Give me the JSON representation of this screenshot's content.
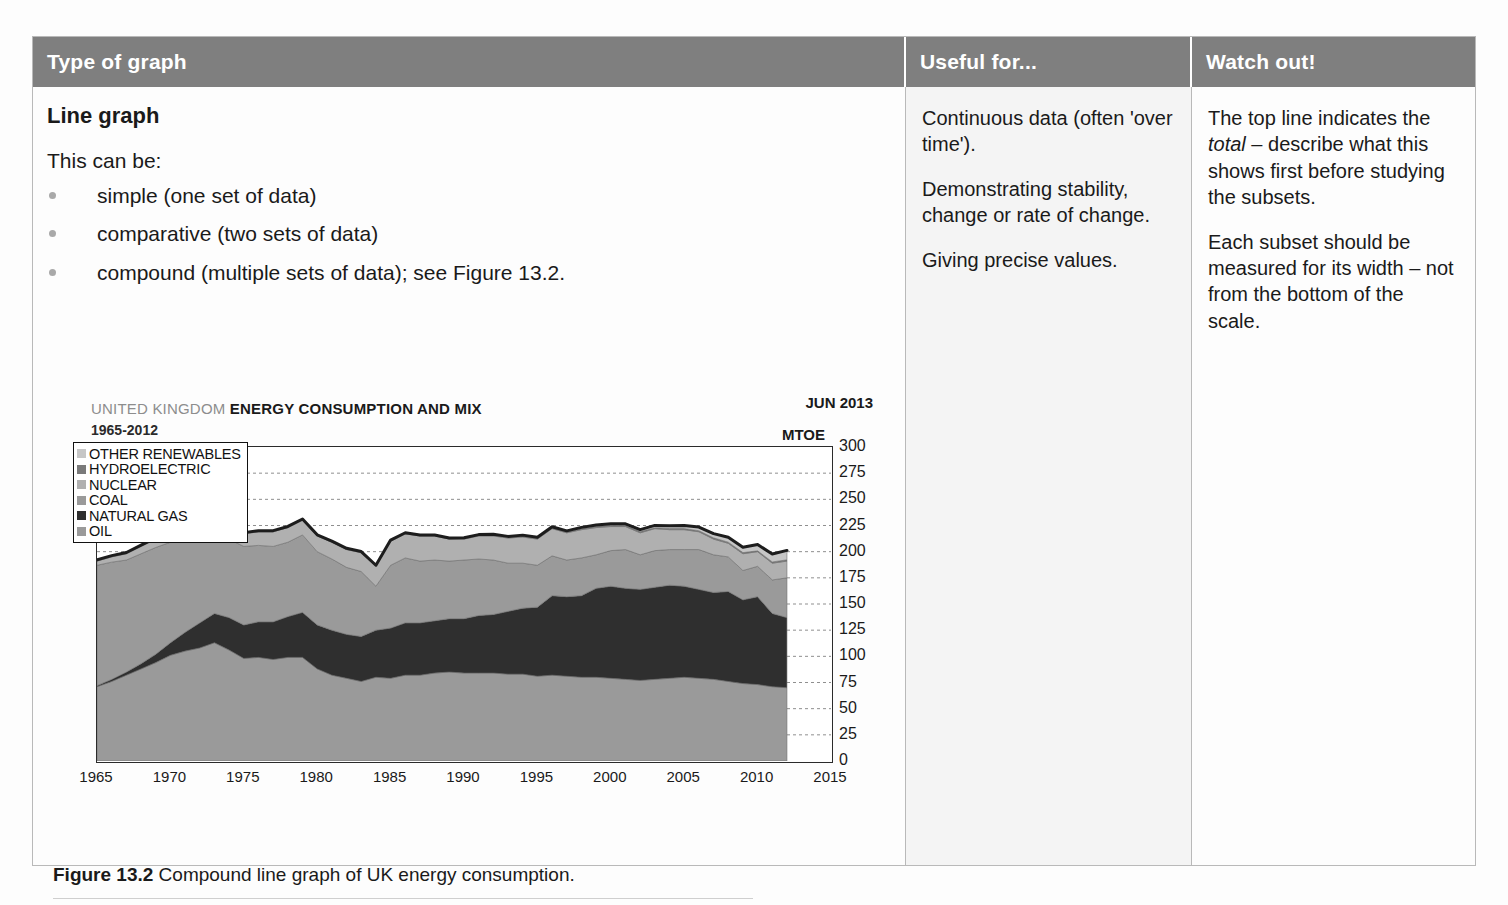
{
  "table": {
    "headers": {
      "type_of_graph": "Type of graph",
      "useful_for": "Useful for...",
      "watch_out": "Watch out!"
    }
  },
  "main": {
    "subhead": "Line graph",
    "lead": "This can be:",
    "bullets": [
      "simple (one set of data)",
      "comparative (two sets of data)",
      "compound (multiple sets of data); see Figure 13.2."
    ],
    "caption_bold": "Figure 13.2",
    "caption_rest": " Compound line graph of UK energy consumption."
  },
  "useful_for": {
    "paragraphs": [
      "Continuous data (often 'over time').",
      "Demonstrating stability, change or rate of change.",
      "Giving precise values."
    ]
  },
  "watch_out": {
    "p1_a": "The top line indicates the ",
    "p1_italic": "total",
    "p1_b": " – describe what this shows first before studying the subsets.",
    "p2": "Each subset should be measured for its width – not from the bottom of the scale."
  },
  "chart_data": {
    "type": "area",
    "title_grey": "UNITED KINGDOM",
    "title_black": "ENERGY CONSUMPTION AND MIX",
    "subtitle": "1965-2012",
    "date_label": "JUN 2013",
    "unit_label": "MTOE",
    "xlabel": "",
    "ylabel": "MTOE",
    "xlim": [
      1965,
      2015
    ],
    "ylim": [
      0,
      300
    ],
    "ytick_step": 25,
    "yticks": [
      0,
      25,
      50,
      75,
      100,
      125,
      150,
      175,
      200,
      225,
      250,
      275,
      300
    ],
    "xticks": [
      1965,
      1970,
      1975,
      1980,
      1985,
      1990,
      1995,
      2000,
      2005,
      2010,
      2015
    ],
    "grid": true,
    "legend_position": "top-left",
    "stacked": true,
    "legend_order_top_to_bottom": [
      "OTHER RENEWABLES",
      "HYDROELECTRIC",
      "NUCLEAR",
      "COAL",
      "NATURAL GAS",
      "OIL"
    ],
    "colors": {
      "OIL": "#9a9a9a",
      "NATURAL GAS": "#2f2f2f",
      "COAL": "#9a9a9a",
      "NUCLEAR": "#b0b0b0",
      "HYDROELECTRIC": "#7a7a7a",
      "OTHER RENEWABLES": "#c6c6c6",
      "total_line": "#1d1d1d"
    },
    "legend_swatches": {
      "OTHER RENEWABLES": "#c6c6c6",
      "HYDROELECTRIC": "#7a7a7a",
      "NUCLEAR": "#b0b0b0",
      "COAL": "#9a9a9a",
      "NATURAL GAS": "#2f2f2f",
      "OIL": "#9a9a9a"
    },
    "x": [
      1965,
      1966,
      1967,
      1968,
      1969,
      1970,
      1971,
      1972,
      1973,
      1974,
      1975,
      1976,
      1977,
      1978,
      1979,
      1980,
      1981,
      1982,
      1983,
      1984,
      1985,
      1986,
      1987,
      1988,
      1989,
      1990,
      1991,
      1992,
      1993,
      1994,
      1995,
      1996,
      1997,
      1998,
      1999,
      2000,
      2001,
      2002,
      2003,
      2004,
      2005,
      2006,
      2007,
      2008,
      2009,
      2010,
      2011,
      2012
    ],
    "series": [
      {
        "name": "OIL",
        "values": [
          71,
          76,
          82,
          88,
          94,
          101,
          105,
          108,
          113,
          106,
          98,
          99,
          97,
          99,
          99,
          88,
          82,
          79,
          76,
          80,
          79,
          82,
          82,
          84,
          85,
          84,
          84,
          84,
          83,
          83,
          81,
          82,
          81,
          80,
          80,
          79,
          78,
          77,
          78,
          79,
          80,
          79,
          78,
          76,
          74,
          73,
          71,
          70
        ]
      },
      {
        "name": "NATURAL GAS",
        "values": [
          1,
          2,
          3,
          5,
          8,
          12,
          18,
          24,
          28,
          31,
          32,
          34,
          36,
          39,
          43,
          42,
          43,
          42,
          43,
          45,
          48,
          50,
          50,
          50,
          51,
          52,
          55,
          56,
          60,
          63,
          66,
          76,
          76,
          78,
          85,
          88,
          87,
          87,
          88,
          89,
          87,
          85,
          83,
          86,
          80,
          84,
          70,
          67
        ]
      },
      {
        "name": "COAL",
        "values": [
          115,
          112,
          107,
          105,
          102,
          96,
          88,
          82,
          80,
          75,
          75,
          73,
          72,
          71,
          74,
          70,
          68,
          64,
          62,
          42,
          60,
          62,
          59,
          58,
          55,
          56,
          54,
          52,
          46,
          43,
          40,
          38,
          35,
          36,
          32,
          34,
          37,
          33,
          35,
          34,
          35,
          38,
          36,
          33,
          28,
          29,
          32,
          38
        ]
      },
      {
        "name": "NUCLEAR",
        "values": [
          4,
          5,
          6,
          7,
          8,
          9,
          10,
          10,
          10,
          11,
          12,
          13,
          14,
          14,
          14,
          15,
          16,
          17,
          18,
          19,
          23,
          23,
          24,
          23,
          21,
          20,
          22,
          23,
          24,
          25,
          25,
          26,
          26,
          27,
          26,
          23,
          22,
          21,
          21,
          19,
          19,
          17,
          15,
          13,
          16,
          14,
          16,
          16
        ]
      },
      {
        "name": "HYDROELECTRIC",
        "values": [
          1.2,
          1.2,
          1.2,
          1.2,
          1.2,
          1.2,
          1.2,
          1.2,
          1.2,
          1.2,
          1.2,
          1.0,
          1.1,
          1.1,
          1.2,
          1.1,
          1.1,
          1.2,
          1.1,
          1.0,
          1.1,
          1.1,
          1.0,
          1.0,
          1.0,
          1.1,
          1.0,
          1.2,
          1.1,
          1.2,
          1.1,
          1.0,
          1.0,
          1.2,
          1.3,
          1.2,
          1.0,
          1.2,
          0.9,
          1.1,
          1.1,
          1.0,
          1.2,
          1.1,
          1.1,
          0.8,
          1.2,
          1.2
        ]
      },
      {
        "name": "OTHER RENEWABLES",
        "values": [
          0,
          0,
          0,
          0,
          0,
          0,
          0,
          0,
          0,
          0,
          0,
          0,
          0,
          0,
          0,
          0,
          0,
          0,
          0,
          0,
          0,
          0,
          0,
          0,
          0,
          0.2,
          0.3,
          0.4,
          0.5,
          0.6,
          0.7,
          0.8,
          0.9,
          1.0,
          1.2,
          1.4,
          1.6,
          1.9,
          2.2,
          2.6,
          3.0,
          3.5,
          4.0,
          4.6,
          5.2,
          6.0,
          7.5,
          9.0
        ]
      }
    ]
  }
}
